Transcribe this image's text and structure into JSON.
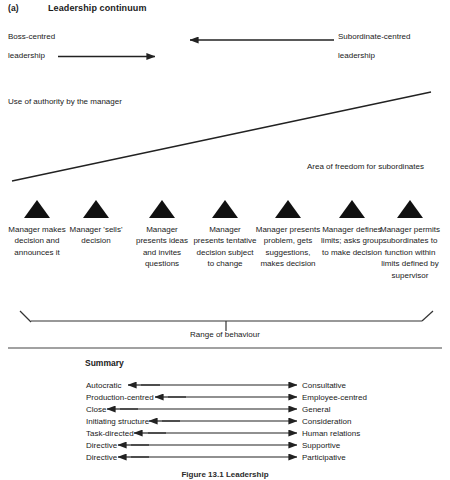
{
  "figure": {
    "part_label": "(a)",
    "title": "Leadership continuum",
    "caption": "Figure 13.1 Leadership"
  },
  "top_axis": {
    "left_label_line1": "Boss-centred",
    "left_label_line2": "leadership",
    "right_label_line1": "Subordinate-centred",
    "right_label_line2": "leadership"
  },
  "wedge": {
    "upper_label": "Use of authority by the manager",
    "lower_label": "Area of freedom for subordinates"
  },
  "continuum": {
    "range_label": "Range of behaviour",
    "steps": [
      {
        "marker": "triangle-marker",
        "text": "Manager\nmakes\ndecision and\nannounces it"
      },
      {
        "marker": "triangle-marker",
        "text": "Manager\n'sells'\ndecision"
      },
      {
        "marker": "triangle-marker",
        "text": "Manager\npresents\nideas and\ninvites\nquestions"
      },
      {
        "marker": "triangle-marker",
        "text": "Manager\npresents\ntentative\ndecision\nsubject to\nchange"
      },
      {
        "marker": "triangle-marker",
        "text": "Manager\npresents\nproblem,\ngets\nsuggestions,\nmakes\ndecision"
      },
      {
        "marker": "triangle-marker",
        "text": "Manager\ndefines\nlimits; asks\ngroup to\nmake\ndecision"
      },
      {
        "marker": "triangle-marker",
        "text": "Manager\npermits\nsubordinates\nto function\nwithin limits\ndefined by\nsupervisor"
      }
    ]
  },
  "summary": {
    "title": "Summary",
    "rows": [
      {
        "left": "Autocratic",
        "right": "Consultative"
      },
      {
        "left": "Production-centred",
        "right": "Employee-centred"
      },
      {
        "left": "Close",
        "right": "General"
      },
      {
        "left": "Initiating structure",
        "right": "Consideration"
      },
      {
        "left": "Task-directed",
        "right": "Human relations"
      },
      {
        "left": "Directive",
        "right": "Supportive"
      },
      {
        "left": "Directive",
        "right": "Participative"
      }
    ]
  },
  "colors": {
    "ink": "#1a1a1a",
    "rule": "#3a3a3a",
    "background": "#ffffff"
  }
}
